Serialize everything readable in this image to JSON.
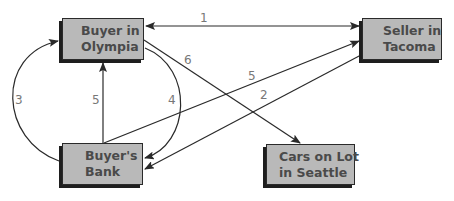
{
  "diagram": {
    "nodes": {
      "buyer": {
        "line1": "Buyer in",
        "line2": "Olympia"
      },
      "seller": {
        "line1": "Seller in",
        "line2": "Tacoma"
      },
      "bank": {
        "line1": "Buyer's",
        "line2": "Bank"
      },
      "cars": {
        "line1": "Cars on Lot",
        "line2": "in Seattle"
      }
    },
    "edges": [
      {
        "label": "1",
        "from": "Buyer in Olympia",
        "to": "Seller in Tacoma",
        "bidirectional": true
      },
      {
        "label": "2",
        "from": "Seller in Tacoma",
        "to": "Buyer's Bank"
      },
      {
        "label": "3",
        "from": "Buyer's Bank",
        "to": "Buyer in Olympia"
      },
      {
        "label": "4",
        "from": "Buyer in Olympia",
        "to": "Buyer's Bank"
      },
      {
        "label": "5",
        "from": "Buyer's Bank",
        "to": "Buyer in Olympia"
      },
      {
        "label": "5",
        "from": "Buyer's Bank",
        "to": "Seller in Tacoma"
      },
      {
        "label": "6",
        "from": "Buyer in Olympia",
        "to": "Cars on Lot in Seattle"
      }
    ],
    "colors": {
      "box_fill": "#b9b9b9",
      "box_border": "#2a2a2a",
      "line": "#2a2a2a",
      "label": "#777777"
    }
  }
}
